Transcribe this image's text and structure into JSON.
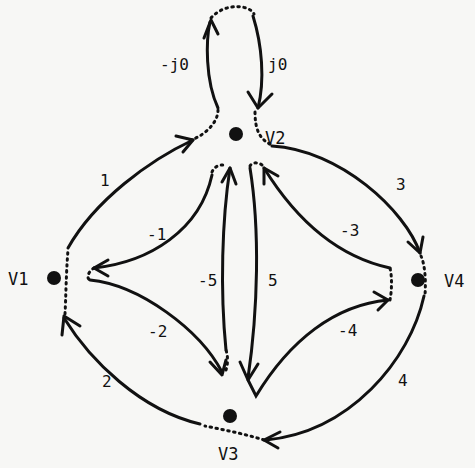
{
  "diagram": {
    "type": "directed-graph",
    "nodes": [
      {
        "id": "V1",
        "label": "V1"
      },
      {
        "id": "V2",
        "label": "V2"
      },
      {
        "id": "V3",
        "label": "V3"
      },
      {
        "id": "V4",
        "label": "V4"
      }
    ],
    "edges": [
      {
        "from": "V1",
        "to": "V2",
        "label": "1"
      },
      {
        "from": "V2",
        "to": "V1",
        "label": "-1"
      },
      {
        "from": "V3",
        "to": "V1",
        "label": "2"
      },
      {
        "from": "V1",
        "to": "V3",
        "label": "-2"
      },
      {
        "from": "V2",
        "to": "V4",
        "label": "3"
      },
      {
        "from": "V4",
        "to": "V2",
        "label": "-3"
      },
      {
        "from": "V4",
        "to": "V3",
        "label": "4"
      },
      {
        "from": "V3",
        "to": "V4",
        "label": "-4"
      },
      {
        "from": "V2",
        "to": "V3",
        "label": "5"
      },
      {
        "from": "V3",
        "to": "V2",
        "label": "-5"
      },
      {
        "from": "V2",
        "to": "V2",
        "label": "j0",
        "note": "self-loop, downward side"
      },
      {
        "from": "V2",
        "to": "V2",
        "label": "-j0",
        "note": "self-loop, upward side"
      }
    ]
  }
}
